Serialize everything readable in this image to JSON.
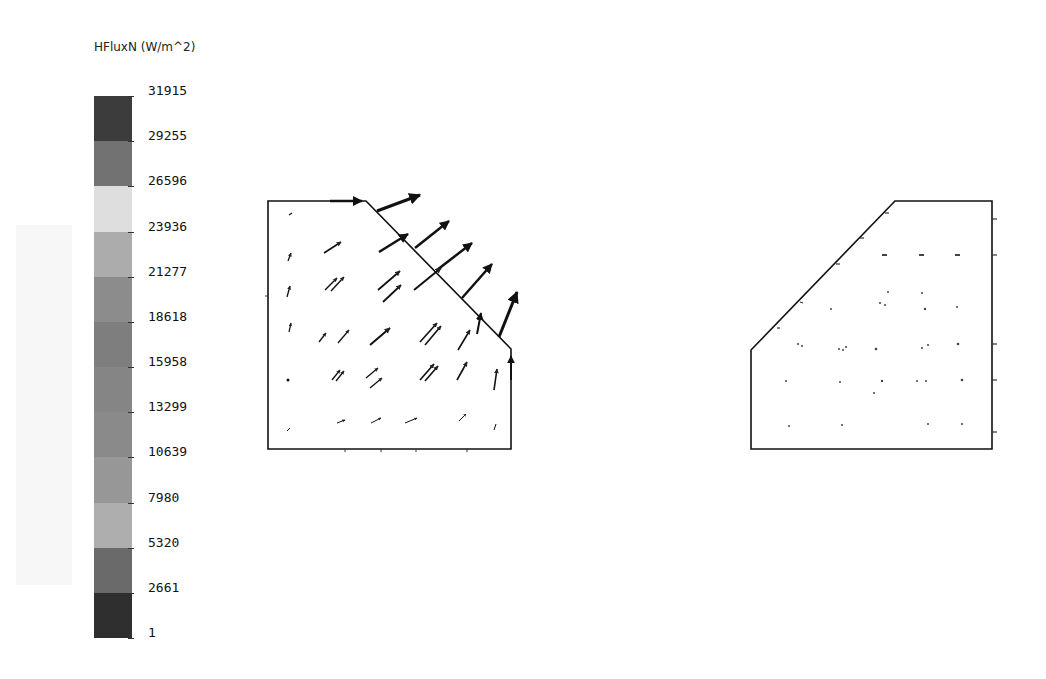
{
  "legend": {
    "title": "HFluxN (W/m^2)",
    "ticks": [
      "31915",
      "29255",
      "26596",
      "23936",
      "21277",
      "18618",
      "15958",
      "13299",
      "10639",
      "7980",
      "5320",
      "2661",
      "1"
    ],
    "segment_colors": [
      "#3c3c3c",
      "#727272",
      "#dedede",
      "#acacac",
      "#8c8c8c",
      "#7e7e7e",
      "#858585",
      "#8a8a8a",
      "#979797",
      "#aeaeae",
      "#6a6a6a",
      "#2f2f2f",
      "#262626"
    ]
  },
  "views": {
    "left": {
      "label": "heat-flux-vector-plot",
      "outline": [
        [
          268,
          201
        ],
        [
          366,
          201
        ],
        [
          511,
          349
        ],
        [
          511,
          449
        ],
        [
          268,
          449
        ]
      ]
    },
    "right": {
      "label": "mirrored-geometry-view",
      "outline": [
        [
          895,
          201
        ],
        [
          992,
          201
        ],
        [
          992,
          449
        ],
        [
          751,
          449
        ],
        [
          751,
          350
        ]
      ]
    }
  }
}
